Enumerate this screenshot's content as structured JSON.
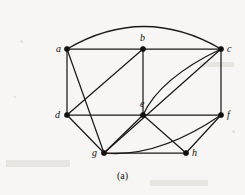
{
  "figure": {
    "caption": "(a)",
    "background_color": "#f7f6f4",
    "ink_color": "#1a1a1a"
  },
  "graph": {
    "type": "undirected-graph",
    "vertex_count": 8,
    "edge_count": 16,
    "vertices": [
      {
        "id": "a",
        "label": "a",
        "x": 67,
        "y": 49,
        "label_dx": -11,
        "label_dy": -5
      },
      {
        "id": "b",
        "label": "b",
        "x": 143,
        "y": 49,
        "label_dx": -3,
        "label_dy": -16
      },
      {
        "id": "c",
        "label": "c",
        "x": 221,
        "y": 49,
        "label_dx": 6,
        "label_dy": -5
      },
      {
        "id": "d",
        "label": "d",
        "x": 67,
        "y": 115,
        "label_dx": -12,
        "label_dy": -5
      },
      {
        "id": "e",
        "label": "e",
        "x": 143,
        "y": 115,
        "label_dx": -3,
        "label_dy": -16
      },
      {
        "id": "f",
        "label": "f",
        "x": 221,
        "y": 115,
        "label_dx": 6,
        "label_dy": -5
      },
      {
        "id": "g",
        "label": "g",
        "x": 104,
        "y": 153,
        "label_dx": -12,
        "label_dy": -5
      },
      {
        "id": "h",
        "label": "h",
        "x": 186,
        "y": 153,
        "label_dx": 6,
        "label_dy": -5
      }
    ],
    "edges": [
      {
        "from": "a",
        "to": "b",
        "shape": "line"
      },
      {
        "from": "b",
        "to": "c",
        "shape": "line"
      },
      {
        "from": "a",
        "to": "c",
        "shape": "arc",
        "cx": 144,
        "cy": 4
      },
      {
        "from": "a",
        "to": "d",
        "shape": "line"
      },
      {
        "from": "a",
        "to": "g",
        "shape": "line"
      },
      {
        "from": "b",
        "to": "d",
        "shape": "line"
      },
      {
        "from": "b",
        "to": "e",
        "shape": "line"
      },
      {
        "from": "c",
        "to": "f",
        "shape": "line"
      },
      {
        "from": "c",
        "to": "e",
        "shape": "arc",
        "cx": 160,
        "cy": 78
      },
      {
        "from": "c",
        "to": "g",
        "shape": "arc",
        "cx": 143,
        "cy": 118
      },
      {
        "from": "d",
        "to": "e",
        "shape": "line"
      },
      {
        "from": "d",
        "to": "g",
        "shape": "line"
      },
      {
        "from": "e",
        "to": "f",
        "shape": "line"
      },
      {
        "from": "e",
        "to": "g",
        "shape": "line"
      },
      {
        "from": "e",
        "to": "h",
        "shape": "line"
      },
      {
        "from": "f",
        "to": "g",
        "shape": "arc",
        "cx": 158,
        "cy": 158
      },
      {
        "from": "f",
        "to": "h",
        "shape": "line"
      },
      {
        "from": "g",
        "to": "h",
        "shape": "line"
      }
    ]
  }
}
